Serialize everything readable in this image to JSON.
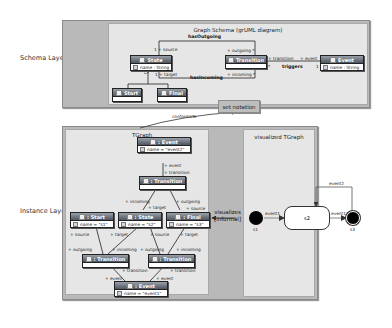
{
  "layers": {
    "schema": "Schema Layer",
    "instance": "Instance Layer"
  },
  "schema": {
    "title": "Graph Schema (grUML diagram)",
    "classes": {
      "state": {
        "name": "State",
        "attr": "name : String"
      },
      "transition": {
        "name": "Transition"
      },
      "event": {
        "name": "Event",
        "attr": "name : String"
      },
      "start": {
        "name": "Start"
      },
      "final": {
        "name": "Final"
      }
    },
    "associations": {
      "has_outgoing": "hasOutgoing",
      "has_incoming": "hasIncoming",
      "triggers": "triggers"
    },
    "roles": {
      "source": "1 + source",
      "target": "1 + target",
      "outgoing": "+ outgoing *",
      "incoming": "+ incoming *",
      "transition": "+ transition",
      "transition_mult": "*",
      "event": "+ event",
      "event_mult": "1"
    }
  },
  "set_notation": "set notation",
  "conforms_to": "conformsTo",
  "tgraph": {
    "title": "TGraph",
    "nodes": {
      "event2": {
        "name": ": Event",
        "attr": "name = \"event2\""
      },
      "transition_top": {
        "name": ": Transition"
      },
      "start": {
        "name": ": Start",
        "attr": "name = \"s1\""
      },
      "state": {
        "name": ": State",
        "attr": "name = \"s2\""
      },
      "final": {
        "name": ": Final",
        "attr": "name = \"s3\""
      },
      "transition_left": {
        "name": ": Transition"
      },
      "transition_right": {
        "name": ": Transition"
      },
      "event1": {
        "name": ": Event",
        "attr": "name = \"event1\""
      }
    },
    "edge_labels": {
      "event_top": "+ event",
      "transition_top": "+ transition",
      "incoming_top": "+ incoming",
      "target_top": "+ target",
      "outgoing_top": "+ outgoing",
      "source_top": "+ source",
      "source_start": "+ source",
      "target_state": "+ target",
      "source_state": "+ source",
      "target_final": "+ target",
      "outgoing_l": "+ outgoing",
      "incoming_l": "+ incoming",
      "outgoing_r": "+ outgoing",
      "incoming_r": "+ incoming",
      "transition_l": "+ transition",
      "transition_r": "+ transition",
      "event_l": "+ event",
      "event_r": "+ event"
    }
  },
  "visualizes": {
    "line1": "visualizes",
    "line2": "[informal]"
  },
  "visualized": {
    "title": "visualized TGraph",
    "states": {
      "s1": "s1",
      "s2": "s2",
      "s3": "s3"
    },
    "transitions": {
      "t1": "event1",
      "t2": "event1",
      "loop": "event2"
    }
  }
}
